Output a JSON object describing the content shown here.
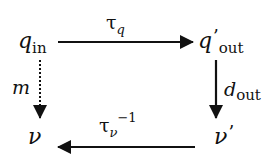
{
  "diagram": {
    "type": "commutative-diagram",
    "nodes": {
      "q_in": {
        "symbol": "q",
        "subscript": "in"
      },
      "q_out": {
        "symbol": "q",
        "prime": "’",
        "subscript": "out"
      },
      "v": {
        "symbol": "ν"
      },
      "v_prime": {
        "symbol": "ν",
        "prime": "’"
      }
    },
    "edges": {
      "top": {
        "from": "q_in",
        "to": "q_out",
        "symbol": "τ",
        "subscript": "q",
        "style": "solid"
      },
      "right": {
        "from": "q_out",
        "to": "v_prime",
        "symbol": "d",
        "subscript": "out",
        "style": "solid"
      },
      "bottom": {
        "from": "v_prime",
        "to": "v",
        "symbol": "τ",
        "subscript": "ν",
        "superscript": "−1",
        "style": "solid"
      },
      "left": {
        "from": "q_in",
        "to": "v",
        "symbol": "m",
        "style": "dotted"
      }
    },
    "colors": {
      "ink": "#111111",
      "background": "#ffffff"
    }
  }
}
